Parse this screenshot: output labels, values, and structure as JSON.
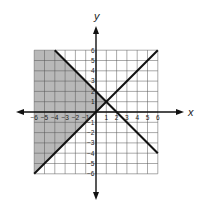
{
  "chart_data": {
    "type": "line",
    "title": "",
    "xlabel": "x",
    "ylabel": "y",
    "xlim": [
      -6,
      6
    ],
    "ylim": [
      -6,
      6
    ],
    "grid": true,
    "x_ticks": [
      "-6",
      "-5",
      "-4",
      "-3",
      "-2",
      "-1",
      "1",
      "2",
      "3",
      "4",
      "5",
      "6"
    ],
    "y_ticks": [
      "6",
      "5",
      "4",
      "3",
      "2",
      "1",
      "-1",
      "-2",
      "-3",
      "-4",
      "-5",
      "-6"
    ],
    "series": [
      {
        "name": "y = x",
        "points": [
          [
            -6,
            -6
          ],
          [
            6,
            6
          ]
        ]
      },
      {
        "name": "y = -x + 2",
        "points": [
          [
            -4,
            6
          ],
          [
            6,
            -4
          ]
        ]
      }
    ],
    "shaded_region": {
      "description": "y >= x and y <= -x + 2, x >= -6",
      "vertices": [
        [
          -6,
          -6
        ],
        [
          1,
          1
        ],
        [
          -4,
          6
        ],
        [
          -6,
          6
        ]
      ],
      "color": "#b8b8b8"
    },
    "intersection": [
      1,
      1
    ]
  }
}
